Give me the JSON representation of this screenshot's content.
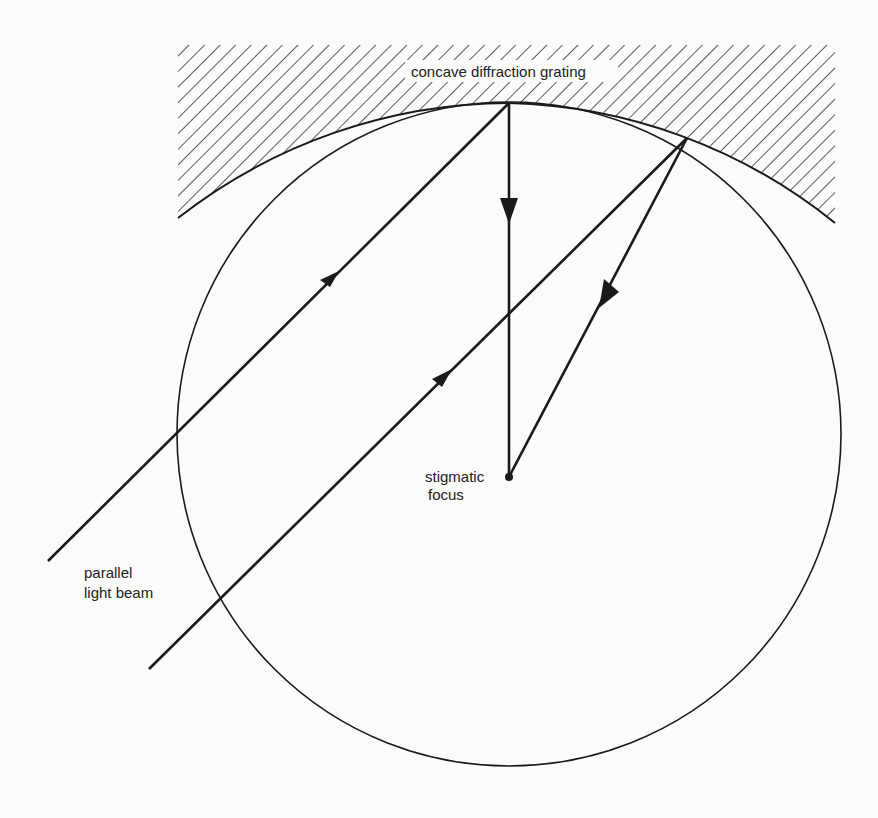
{
  "figure": {
    "type": "optics-diagram",
    "labels": {
      "grating": "concave diffraction grating",
      "focus_line1": "stigmatic",
      "focus_line2": "focus",
      "beam_line1": "parallel",
      "beam_line2": "light beam"
    },
    "colors": {
      "ink": "#1a1a1a",
      "background": "#fbfbfa"
    },
    "elements": [
      {
        "name": "rowland-circle",
        "kind": "circle"
      },
      {
        "name": "grating-surface",
        "kind": "arc-with-hatching"
      },
      {
        "name": "incident-ray-1",
        "kind": "arrow-line"
      },
      {
        "name": "incident-ray-2",
        "kind": "arrow-line"
      },
      {
        "name": "diffracted-ray-vertical",
        "kind": "arrow-line"
      },
      {
        "name": "diffracted-ray-2",
        "kind": "arrow-line"
      },
      {
        "name": "focus-point",
        "kind": "dot"
      }
    ]
  }
}
